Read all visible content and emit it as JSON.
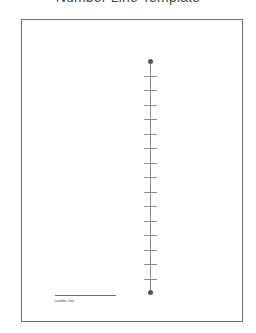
{
  "document": {
    "title": "Number Line Template"
  },
  "sheet": {
    "caption": {
      "label": "number line"
    }
  },
  "chart_data": {
    "type": "line",
    "title": "Number Line Template",
    "orientation": "vertical",
    "xlabel": "",
    "ylabel": "",
    "grid": false,
    "legend": null,
    "axis": {
      "start_endpoint": "arrow-point",
      "end_endpoint": "arrow-point",
      "tick_count": 15,
      "tick_labels": [
        "",
        "",
        "",
        "",
        "",
        "",
        "",
        "",
        "",
        "",
        "",
        "",
        "",
        "",
        ""
      ],
      "tick_positions": [
        0,
        1,
        2,
        3,
        4,
        5,
        6,
        7,
        8,
        9,
        10,
        11,
        12,
        13,
        14
      ]
    },
    "values": [],
    "annotations": [
      "number line"
    ]
  },
  "colors": {
    "page_background": "#ffffff",
    "frame_border": "#6f6f73",
    "axis_line": "#8a8a8e",
    "tick_mark": "#8e8e93",
    "endpoint": "#55555a",
    "title_text": "#4a4a4a",
    "caption_text": "#3d3d42"
  }
}
